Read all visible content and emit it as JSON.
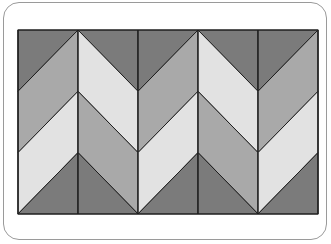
{
  "figure": {
    "columns": 5,
    "column_width": 60,
    "rect": {
      "x": 18,
      "y": 30,
      "width": 300,
      "height": 184
    },
    "zigzag_peaks_y": [
      30,
      91.3,
      152.7
    ],
    "zigzag_amplitude": 61.3,
    "colors": {
      "dark": "#7b7b7b",
      "medium": "#a9a9a9",
      "light": "#e2e2e2",
      "stroke": "#1e1e1e",
      "frame": "#9a9a9a"
    },
    "bands": [
      {
        "name": "top",
        "pattern": [
          "dark",
          "dark",
          "dark",
          "dark",
          "dark"
        ]
      },
      {
        "name": "upper",
        "pattern": [
          "medium",
          "light",
          "medium",
          "light",
          "medium"
        ]
      },
      {
        "name": "lower",
        "pattern": [
          "light",
          "medium",
          "light",
          "medium",
          "light"
        ]
      },
      {
        "name": "bottom",
        "pattern": [
          "dark",
          "dark",
          "dark",
          "dark",
          "dark"
        ]
      }
    ]
  }
}
